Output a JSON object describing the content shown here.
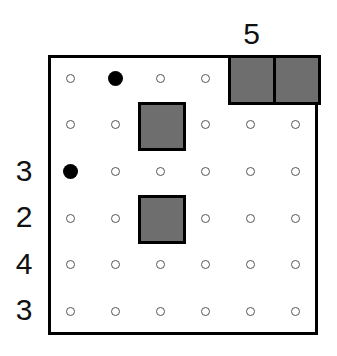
{
  "puzzle": {
    "rows": 6,
    "cols": 6,
    "column_clues": [
      {
        "col": 4,
        "label": "5"
      }
    ],
    "row_clues": [
      {
        "row": 2,
        "label": "3"
      },
      {
        "row": 3,
        "label": "2"
      },
      {
        "row": 4,
        "label": "4"
      },
      {
        "row": 5,
        "label": "3"
      }
    ],
    "grid": [
      [
        "empty",
        "stone",
        "empty",
        "empty",
        "block",
        "block"
      ],
      [
        "empty",
        "empty",
        "block",
        "empty",
        "empty",
        "empty"
      ],
      [
        "stone",
        "empty",
        "empty",
        "empty",
        "empty",
        "empty"
      ],
      [
        "empty",
        "empty",
        "block",
        "empty",
        "empty",
        "empty"
      ],
      [
        "empty",
        "empty",
        "empty",
        "empty",
        "empty",
        "empty"
      ],
      [
        "empty",
        "empty",
        "empty",
        "empty",
        "empty",
        "empty"
      ]
    ],
    "colors": {
      "block": "#6e6e6e",
      "stone": "#000000",
      "dot_border": "#555555"
    }
  }
}
